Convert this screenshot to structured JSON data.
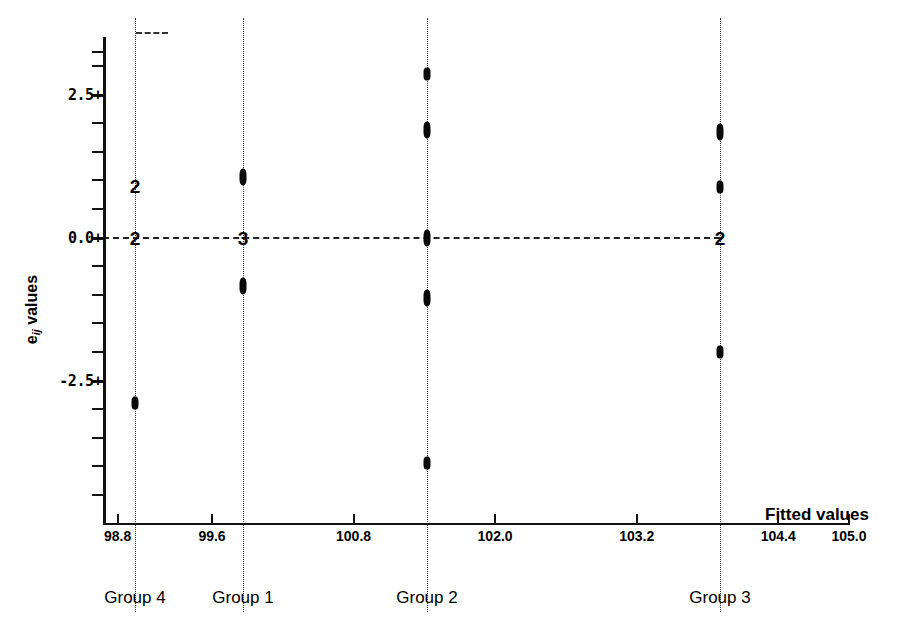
{
  "chart_data": {
    "type": "scatter",
    "title": "",
    "subtitle": "",
    "xlabel": "Fitted values",
    "ylabel": "e ij values",
    "ylabel_main": "e",
    "ylabel_sub": "ij",
    "ylabel_tail": " values",
    "xlim": [
      98.4,
      105.6
    ],
    "ylim": [
      -4.6,
      3.4
    ],
    "grid": false,
    "legend": "none",
    "zero_reference_line": 0.0,
    "x_tick_labels": [
      "98.8",
      "99.6",
      "100.8",
      "102.0",
      "103.2",
      "104.4",
      "105.0"
    ],
    "x_tick_values": [
      98.8,
      99.6,
      100.8,
      102.0,
      103.2,
      104.4,
      105.0
    ],
    "y_tick_labels": [
      "2.5+",
      "0.0+",
      "-2.5+"
    ],
    "y_tick_values": [
      2.5,
      0.0,
      -2.5
    ],
    "y_minor_ticks": [
      3.25,
      3.0,
      2.0,
      1.5,
      1.0,
      0.5,
      -0.5,
      -1.0,
      -1.5,
      -2.0,
      -3.0,
      -3.5,
      -4.0,
      -4.5
    ],
    "group_labels": [
      "Group 4",
      "Group 1",
      "Group 2",
      "Group 3"
    ],
    "series": [
      {
        "name": "Group 4",
        "fitted_value": 99.8,
        "x_px": 135,
        "points": [
          {
            "value": 0.9,
            "label": "2",
            "count": 2,
            "type": "digit"
          },
          {
            "value": 0.0,
            "label": "2",
            "count": 2,
            "type": "digit"
          },
          {
            "value": -2.9,
            "label": "",
            "count": 1,
            "type": "marker"
          }
        ]
      },
      {
        "name": "Group 1",
        "fitted_value": 100.0,
        "x_px": 243,
        "points": [
          {
            "value": 1.05,
            "label": "",
            "count": 2,
            "type": "marker"
          },
          {
            "value": 0.0,
            "label": "3",
            "count": 3,
            "type": "digit"
          },
          {
            "value": -0.85,
            "label": "",
            "count": 2,
            "type": "marker"
          }
        ]
      },
      {
        "name": "Group 2",
        "fitted_value": 102.0,
        "x_px": 427,
        "points": [
          {
            "value": 2.85,
            "label": "",
            "count": 1,
            "type": "marker"
          },
          {
            "value": 1.88,
            "label": "",
            "count": 2,
            "type": "marker"
          },
          {
            "value": 0.0,
            "label": "",
            "count": 2,
            "type": "marker"
          },
          {
            "value": -1.05,
            "label": "",
            "count": 2,
            "type": "marker"
          },
          {
            "value": -3.95,
            "label": "",
            "count": 1,
            "type": "marker"
          }
        ]
      },
      {
        "name": "Group 3",
        "fitted_value": 105.0,
        "x_px": 720,
        "points": [
          {
            "value": 1.85,
            "label": "",
            "count": 2,
            "type": "marker"
          },
          {
            "value": 0.88,
            "label": "",
            "count": 1,
            "type": "marker"
          },
          {
            "value": 0.0,
            "label": "2",
            "count": 2,
            "type": "digit"
          },
          {
            "value": -2.0,
            "label": "",
            "count": 1,
            "type": "marker"
          }
        ]
      }
    ]
  },
  "colors": {
    "ink": "#000000",
    "axis": "#111111",
    "grid_dotted": "#333333",
    "background": "#ffffff"
  }
}
